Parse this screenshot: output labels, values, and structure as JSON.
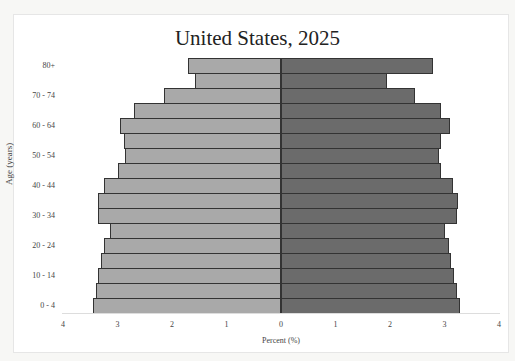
{
  "chart_data": {
    "type": "bar",
    "orientation": "horizontal",
    "subtype": "population-pyramid",
    "title": "United States, 2025",
    "xlabel": "Percent (%)",
    "ylabel": "Age (years)",
    "xlim": [
      -4,
      4
    ],
    "x_ticks": [
      "4",
      "3",
      "2",
      "1",
      "0",
      "1",
      "2",
      "3",
      "4"
    ],
    "y_tick_labels_shown": [
      "80+",
      "70 - 74",
      "60 - 64",
      "50 - 54",
      "40 - 44",
      "30 - 34",
      "20 - 24",
      "10 - 14",
      "0 - 4"
    ],
    "categories": [
      "0 - 4",
      "5 - 9",
      "10 - 14",
      "15 - 19",
      "20 - 24",
      "25 - 29",
      "30 - 34",
      "35 - 39",
      "40 - 44",
      "45 - 49",
      "50 - 54",
      "55 - 59",
      "60 - 64",
      "65 - 69",
      "70 - 74",
      "75 - 79",
      "80+"
    ],
    "series": [
      {
        "name": "Left (light gray)",
        "color": "#a9a9a9",
        "values": [
          3.45,
          3.39,
          3.36,
          3.3,
          3.25,
          3.14,
          3.36,
          3.36,
          3.25,
          2.99,
          2.86,
          2.88,
          2.96,
          2.7,
          2.14,
          1.57,
          1.7
        ]
      },
      {
        "name": "Right (dark gray)",
        "color": "#6b6b6b",
        "values": [
          3.28,
          3.23,
          3.17,
          3.12,
          3.08,
          3.01,
          3.23,
          3.25,
          3.16,
          2.94,
          2.89,
          2.94,
          3.11,
          2.94,
          2.45,
          1.94,
          2.78
        ]
      }
    ],
    "grid": false,
    "legend": "none"
  }
}
